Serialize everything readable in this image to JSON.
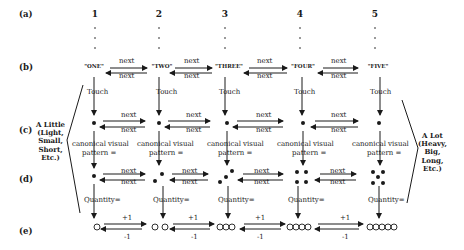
{
  "row_labels": [
    "(a)",
    "(b)",
    "(c)",
    "(d)",
    "(e)"
  ],
  "columns": [
    {
      "number": "1",
      "word": "\"ONE\"",
      "quantity_circles": 1,
      "dot_count": 1
    },
    {
      "number": "2",
      "word": "\"TWO\"",
      "quantity_circles": 2,
      "dot_count": 2
    },
    {
      "number": "3",
      "word": "\"THREE\"",
      "quantity_circles": 3,
      "dot_count": 3
    },
    {
      "number": "4",
      "word": "\"FOUR\"",
      "quantity_circles": 4,
      "dot_count": 4
    },
    {
      "number": "5",
      "word": "\"FIVE\"",
      "quantity_circles": 5,
      "dot_count": 5
    }
  ],
  "labels": {
    "next": "next",
    "touch": "Touch",
    "canonical_line1": "canonical visual",
    "canonical_line2": "pattern =",
    "quantity": "Quantity=",
    "plus_one": "+1",
    "minus_one": "-1"
  },
  "left_side": {
    "lines": [
      "A Little",
      "(Light,",
      "Small,",
      "Short,",
      "Etc.)"
    ]
  },
  "right_side": {
    "lines": [
      "A Lot",
      "(Heavy,",
      "Big,",
      "Long,",
      "Etc.)"
    ]
  }
}
